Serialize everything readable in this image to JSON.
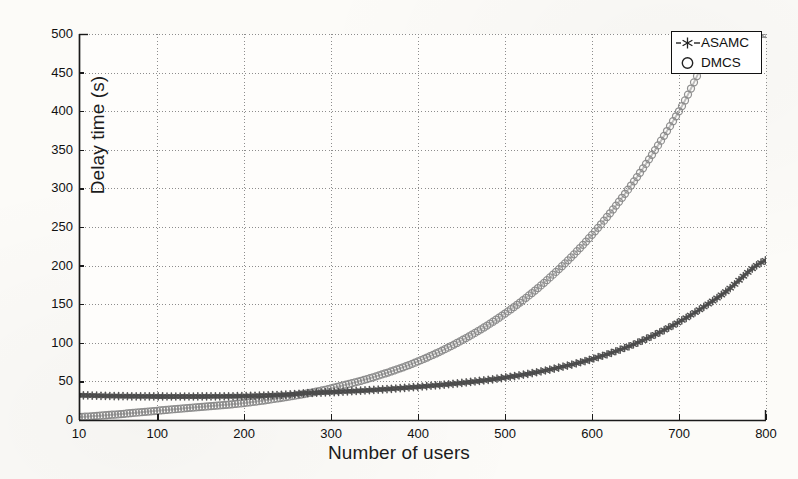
{
  "chart_data": {
    "type": "line",
    "title": "",
    "xlabel": "Number of users",
    "ylabel": "Delay time (s)",
    "xlim": [
      10,
      800
    ],
    "ylim": [
      0,
      500
    ],
    "xticks": [
      10,
      100,
      200,
      300,
      400,
      500,
      600,
      700,
      800
    ],
    "xtick_labels": [
      "10",
      "100",
      "200",
      "300",
      "400",
      "500",
      "600",
      "700",
      "800"
    ],
    "yticks": [
      0,
      50,
      100,
      150,
      200,
      250,
      300,
      350,
      400,
      450,
      500
    ],
    "ytick_labels": [
      "0",
      "50",
      "100",
      "150",
      "200",
      "250",
      "300",
      "350",
      "400",
      "450",
      "500"
    ],
    "grid": true,
    "grid_style": "dotted",
    "legend_position": "upper right",
    "x": [
      10,
      50,
      100,
      150,
      200,
      250,
      275,
      300,
      350,
      400,
      450,
      500,
      550,
      600,
      650,
      700,
      750,
      800
    ],
    "series": [
      {
        "name": "ASAMC",
        "marker": "star",
        "linestyle": "dashed",
        "color": "#4b4b4b",
        "values": [
          32,
          31,
          30.5,
          30.5,
          31,
          33,
          35,
          36,
          39,
          43,
          48,
          55,
          65,
          79,
          99,
          127,
          163,
          207
        ]
      },
      {
        "name": "DMCS",
        "marker": "circle",
        "linestyle": "solid",
        "color": "#8a8a8a",
        "values": [
          4,
          7,
          12,
          17,
          22,
          30,
          35,
          41,
          56,
          76,
          103,
          138,
          183,
          240,
          312,
          400,
          500,
          500
        ],
        "note": "clipped at y=500 near x=705"
      }
    ]
  },
  "legend": {
    "entries": [
      {
        "label": "ASAMC",
        "marker": "star-marker-icon"
      },
      {
        "label": "DMCS",
        "marker": "circle-marker-icon"
      }
    ]
  },
  "axes": {
    "x_axis_label": "Number of users",
    "y_axis_label": "Delay time (s)"
  },
  "colors": {
    "asamc": "#4b4b4b",
    "dmcs": "#8a8a8a",
    "axis": "#1a1a1a",
    "grid": "#8d8d8d",
    "background": "#fcfbf8"
  }
}
